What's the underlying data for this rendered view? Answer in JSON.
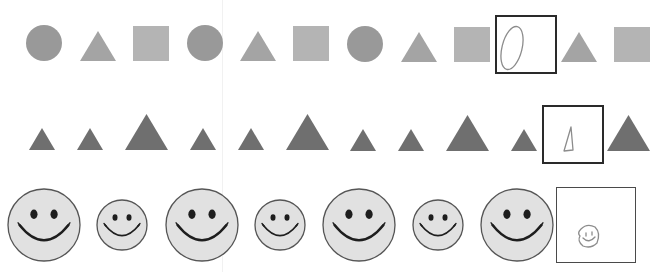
{
  "worksheet": {
    "type": "pattern-completion",
    "colors": {
      "background": "#ffffff",
      "circle_fill": "#999999",
      "row1_triangle_fill": "#a4a4a4",
      "square_fill": "#b4b4b4",
      "row2_triangle_fill": "#6f6f6f",
      "smiley_fill": "#e1e1e1",
      "smiley_stroke": "#555555",
      "smiley_features": "#1e1e1e",
      "box_border": "#2a2a2a",
      "pencil": "#8c8c8c"
    },
    "rows": [
      {
        "id": "row-1-shapes",
        "pattern": [
          "circle",
          "triangle",
          "square"
        ],
        "items": [
          {
            "kind": "circle",
            "cx": 44,
            "cy": 43,
            "r": 18
          },
          {
            "kind": "triangle",
            "x": 80,
            "y": 31,
            "w": 36,
            "h": 30
          },
          {
            "kind": "square",
            "x": 133,
            "y": 26,
            "w": 36,
            "h": 35
          },
          {
            "kind": "circle",
            "cx": 205,
            "cy": 43,
            "r": 18
          },
          {
            "kind": "triangle",
            "x": 240,
            "y": 31,
            "w": 36,
            "h": 30
          },
          {
            "kind": "square",
            "x": 293,
            "y": 26,
            "w": 36,
            "h": 35
          },
          {
            "kind": "circle",
            "cx": 365,
            "cy": 44,
            "r": 18
          },
          {
            "kind": "triangle",
            "x": 401,
            "y": 32,
            "w": 36,
            "h": 30
          },
          {
            "kind": "square",
            "x": 454,
            "y": 27,
            "w": 36,
            "h": 35
          },
          {
            "kind": "answer-box",
            "x": 495,
            "y": 15,
            "w": 62,
            "h": 59,
            "drawing": "pencil-oval"
          },
          {
            "kind": "triangle",
            "x": 561,
            "y": 32,
            "w": 36,
            "h": 30
          },
          {
            "kind": "square",
            "x": 614,
            "y": 27,
            "w": 36,
            "h": 35
          }
        ]
      },
      {
        "id": "row-2-triangles",
        "pattern": [
          "small-triangle",
          "small-triangle",
          "large-triangle"
        ],
        "items": [
          {
            "kind": "small-triangle",
            "x": 29,
            "y": 128,
            "w": 26,
            "h": 22
          },
          {
            "kind": "small-triangle",
            "x": 77,
            "y": 128,
            "w": 26,
            "h": 22
          },
          {
            "kind": "large-triangle",
            "x": 125,
            "y": 114,
            "w": 43,
            "h": 36
          },
          {
            "kind": "small-triangle",
            "x": 190,
            "y": 128,
            "w": 26,
            "h": 22
          },
          {
            "kind": "small-triangle",
            "x": 238,
            "y": 128,
            "w": 26,
            "h": 22
          },
          {
            "kind": "large-triangle",
            "x": 286,
            "y": 114,
            "w": 43,
            "h": 36
          },
          {
            "kind": "small-triangle",
            "x": 350,
            "y": 129,
            "w": 26,
            "h": 22
          },
          {
            "kind": "small-triangle",
            "x": 398,
            "y": 129,
            "w": 26,
            "h": 22
          },
          {
            "kind": "large-triangle",
            "x": 446,
            "y": 115,
            "w": 43,
            "h": 36
          },
          {
            "kind": "small-triangle",
            "x": 511,
            "y": 129,
            "w": 26,
            "h": 22
          },
          {
            "kind": "answer-box",
            "x": 542,
            "y": 105,
            "w": 62,
            "h": 59,
            "drawing": "pencil-small-triangle"
          },
          {
            "kind": "large-triangle",
            "x": 607,
            "y": 115,
            "w": 43,
            "h": 36
          }
        ]
      },
      {
        "id": "row-3-smileys",
        "pattern": [
          "large-smiley",
          "small-smiley"
        ],
        "items": [
          {
            "kind": "large-smiley",
            "cx": 44,
            "cy": 225,
            "r": 36
          },
          {
            "kind": "small-smiley",
            "cx": 122,
            "cy": 225,
            "r": 25
          },
          {
            "kind": "large-smiley",
            "cx": 202,
            "cy": 225,
            "r": 36
          },
          {
            "kind": "small-smiley",
            "cx": 280,
            "cy": 225,
            "r": 25
          },
          {
            "kind": "large-smiley",
            "cx": 359,
            "cy": 225,
            "r": 36
          },
          {
            "kind": "small-smiley",
            "cx": 438,
            "cy": 225,
            "r": 25
          },
          {
            "kind": "large-smiley",
            "cx": 517,
            "cy": 225,
            "r": 36
          },
          {
            "kind": "answer-box",
            "x": 556,
            "y": 187,
            "w": 80,
            "h": 76,
            "drawing": "pencil-small-smiley"
          }
        ]
      }
    ]
  }
}
